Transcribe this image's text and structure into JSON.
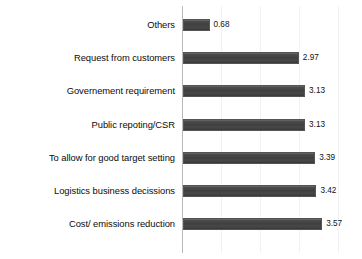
{
  "chart_data": {
    "type": "bar",
    "orientation": "horizontal",
    "title": "",
    "xlabel": "",
    "ylabel": "",
    "xlim": [
      0,
      4.0
    ],
    "grid": true,
    "legend": false,
    "categories": [
      "Others",
      "Request from customers",
      "Governement requirement",
      "Public repoting/CSR",
      "To allow for good target setting",
      "Logistics business decissions",
      "Cost/ emissions reduction"
    ],
    "values": [
      0.68,
      2.97,
      3.13,
      3.13,
      3.39,
      3.42,
      3.57
    ],
    "value_labels": [
      "0.68",
      "2.97",
      "3.13",
      "3.13",
      "3.39",
      "3.42",
      "3.57"
    ],
    "bar_color": "#444444",
    "bar_edge_color": "#545454",
    "background_color": "#ffffff",
    "gridline_color": "#f2f2f2",
    "axis_color": "#b9b9b9"
  }
}
